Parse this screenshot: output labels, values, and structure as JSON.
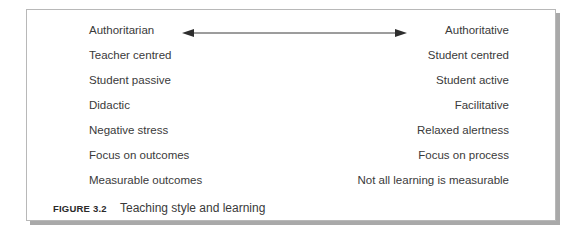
{
  "figure": {
    "rows": [
      {
        "left": "Authoritarian",
        "right": "Authoritative",
        "has_arrow": true
      },
      {
        "left": "Teacher centred",
        "right": "Student centred"
      },
      {
        "left": "Student passive",
        "right": "Student active"
      },
      {
        "left": "Didactic",
        "right": "Facilitative"
      },
      {
        "left": "Negative stress",
        "right": "Relaxed alertness"
      },
      {
        "left": "Focus on outcomes",
        "right": "Focus on process"
      },
      {
        "left": "Measurable outcomes",
        "right": "Not all learning is measurable"
      }
    ],
    "arrow": {
      "type": "double-headed",
      "color": "#3a3a3a"
    },
    "caption": {
      "number": "FIGURE 3.2",
      "text": "Teaching style and learning"
    }
  }
}
